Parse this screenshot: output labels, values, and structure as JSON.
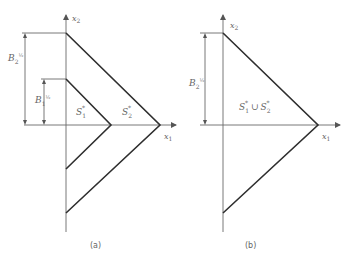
{
  "panels": [
    {
      "id": "a",
      "caption": "(a)",
      "axis_x_label": "x",
      "axis_x_sub": "1",
      "axis_y_label": "x",
      "axis_y_sub": "2",
      "dims": [
        {
          "base": "B",
          "sub": "2",
          "sup": "½"
        },
        {
          "base": "B",
          "sub": "1",
          "sup": "½"
        }
      ],
      "regions": [
        {
          "base": "S",
          "sub": "1",
          "sup": "*"
        },
        {
          "base": "S",
          "sub": "2",
          "sup": "*"
        }
      ]
    },
    {
      "id": "b",
      "caption": "(b)",
      "axis_x_label": "x",
      "axis_x_sub": "1",
      "axis_y_label": "x",
      "axis_y_sub": "2",
      "dims": [
        {
          "base": "B",
          "sub": "2",
          "sup": "½"
        }
      ],
      "regions": [
        {
          "text_a": "S",
          "sub_a": "1",
          "sup_a": "*",
          "union": "∪",
          "text_b": "S",
          "sub_b": "2",
          "sup_b": "*"
        }
      ]
    }
  ],
  "colors": {
    "shape": "#2e2e2e",
    "axis": "#6a6a6a",
    "text": "#666666"
  }
}
